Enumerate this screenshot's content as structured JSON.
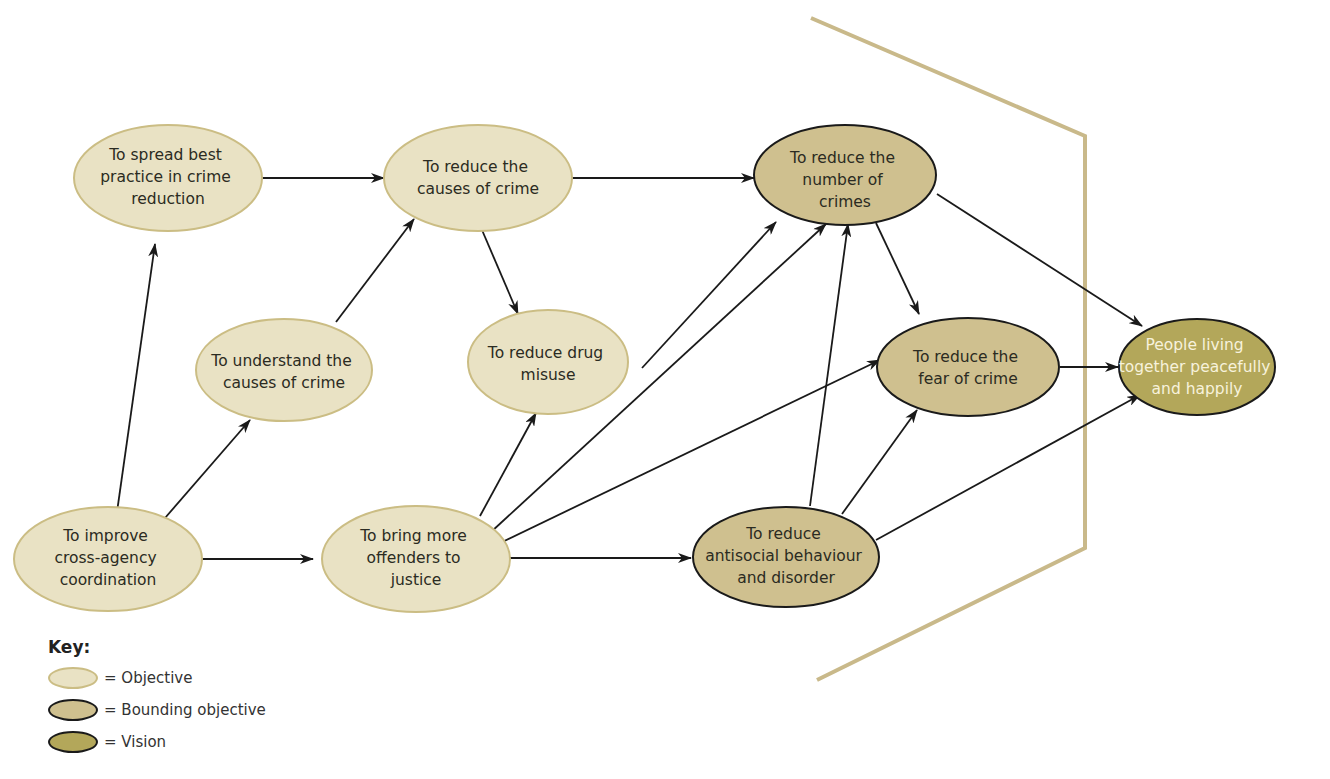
{
  "colors": {
    "objective_fill": "#e9e2c4",
    "objective_stroke": "#cbbd84",
    "bounding_fill": "#cfc08f",
    "vision_fill": "#b3a75a",
    "boundary_line": "#c9b98a",
    "edge": "#1a1a1a"
  },
  "nodes": {
    "spread_best_practice": {
      "type": "objective",
      "lines": [
        "To spread best",
        "practice in crime",
        "reduction"
      ]
    },
    "reduce_causes": {
      "type": "objective",
      "lines": [
        "To reduce the",
        "causes of crime"
      ]
    },
    "understand_causes": {
      "type": "objective",
      "lines": [
        "To understand the",
        "causes of crime"
      ]
    },
    "reduce_drug_misuse": {
      "type": "objective",
      "lines": [
        "To reduce drug",
        "misuse"
      ]
    },
    "improve_coordination": {
      "type": "objective",
      "lines": [
        "To improve",
        "cross-agency",
        "coordination"
      ]
    },
    "bring_offenders": {
      "type": "objective",
      "lines": [
        "To bring more",
        "offenders to",
        "justice"
      ]
    },
    "reduce_number_crimes": {
      "type": "bounding",
      "lines": [
        "To reduce the",
        "number of",
        "crimes"
      ]
    },
    "reduce_fear": {
      "type": "bounding",
      "lines": [
        "To reduce the",
        "fear of crime"
      ]
    },
    "reduce_antisocial": {
      "type": "bounding",
      "lines": [
        "To reduce",
        "antisocial behaviour",
        "and disorder"
      ]
    },
    "vision": {
      "type": "vision",
      "lines": [
        "People living",
        "together peacefully",
        "and happily"
      ]
    }
  },
  "edges": [
    [
      "spread_best_practice",
      "reduce_causes"
    ],
    [
      "reduce_causes",
      "reduce_number_crimes"
    ],
    [
      "reduce_causes",
      "reduce_drug_misuse"
    ],
    [
      "understand_causes",
      "reduce_causes"
    ],
    [
      "improve_coordination",
      "spread_best_practice"
    ],
    [
      "improve_coordination",
      "understand_causes"
    ],
    [
      "improve_coordination",
      "bring_offenders"
    ],
    [
      "bring_offenders",
      "reduce_drug_misuse"
    ],
    [
      "bring_offenders",
      "reduce_number_crimes"
    ],
    [
      "bring_offenders",
      "reduce_fear"
    ],
    [
      "bring_offenders",
      "reduce_antisocial"
    ],
    [
      "reduce_drug_misuse",
      "reduce_number_crimes"
    ],
    [
      "reduce_number_crimes",
      "reduce_fear"
    ],
    [
      "reduce_number_crimes",
      "vision"
    ],
    [
      "reduce_antisocial",
      "reduce_number_crimes"
    ],
    [
      "reduce_antisocial",
      "reduce_fear"
    ],
    [
      "reduce_antisocial",
      "vision"
    ],
    [
      "reduce_fear",
      "vision"
    ]
  ],
  "key": {
    "title": "Key:",
    "items": [
      {
        "type": "objective",
        "label": "= Objective"
      },
      {
        "type": "bounding",
        "label": "= Bounding objective"
      },
      {
        "type": "vision",
        "label": "= Vision"
      }
    ]
  }
}
